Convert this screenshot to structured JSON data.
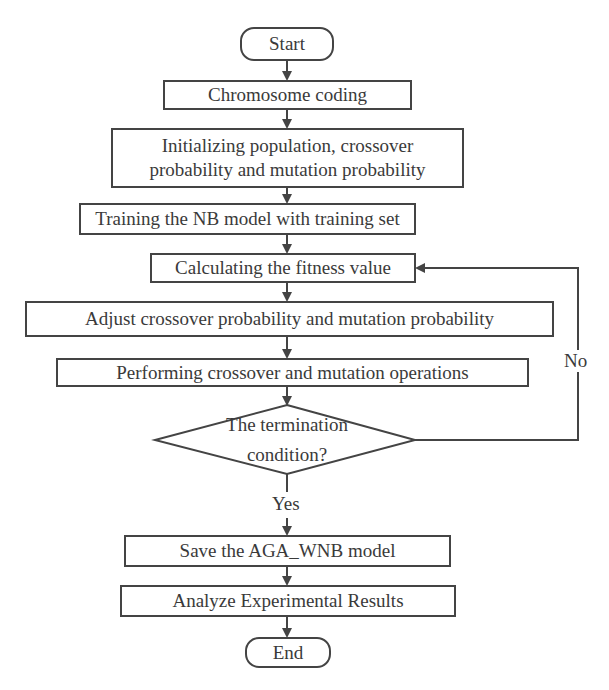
{
  "flowchart": {
    "nodes": {
      "start": "Start",
      "chromosome_coding": "Chromosome coding",
      "initializing_line1": "Initializing population, crossover",
      "initializing_line2": "probability and mutation probability",
      "training": "Training the NB model with training set",
      "calculating": "Calculating the fitness value",
      "adjust": "Adjust crossover probability and mutation probability",
      "performing": "Performing crossover and mutation operations",
      "decision_line1": "The termination",
      "decision_line2": "condition?",
      "save": "Save the AGA_WNB model",
      "analyze": "Analyze Experimental Results",
      "end": "End"
    },
    "edge_labels": {
      "yes": "Yes",
      "no": "No"
    },
    "colors": {
      "stroke": "#444444",
      "text": "#3a3a3a",
      "background": "#ffffff"
    }
  }
}
